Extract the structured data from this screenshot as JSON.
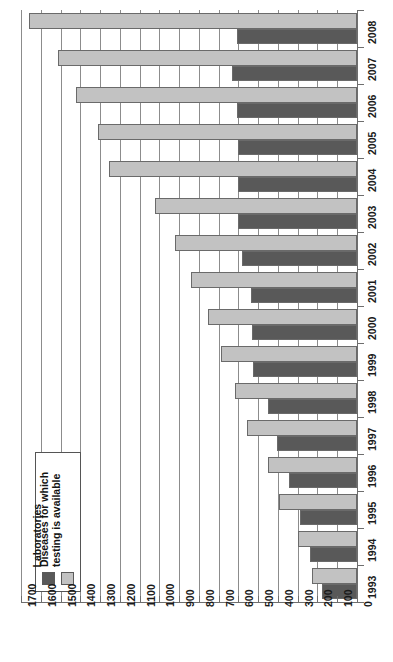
{
  "chart_data": {
    "type": "bar",
    "title": "",
    "subtitle": "",
    "xlabel": "",
    "ylabel": "",
    "orientation": "horizontal",
    "value_axis_reversed": true,
    "value_axis_ticks": [
      1700,
      1600,
      1500,
      1400,
      1300,
      1200,
      1100,
      1000,
      900,
      800,
      700,
      600,
      500,
      400,
      300,
      200,
      100,
      0
    ],
    "value_axis_range": [
      0,
      1700
    ],
    "grid": true,
    "legend_position": "bottom-left-inside",
    "categories": [
      "2008",
      "2007",
      "2006",
      "2005",
      "2004",
      "2003",
      "2002",
      "2001",
      "2000",
      "1999",
      "1998",
      "1997",
      "1996",
      "1995",
      "1994",
      "1993"
    ],
    "series": [
      {
        "name": "Diseases for which testing is available",
        "color": "#c2c2c2",
        "values": [
          1657,
          1515,
          1420,
          1310,
          1255,
          1020,
          920,
          840,
          755,
          690,
          615,
          555,
          450,
          395,
          300,
          230
        ]
      },
      {
        "name": "Laboratories",
        "color": "#595959",
        "values": [
          605,
          630,
          605,
          600,
          600,
          600,
          580,
          535,
          530,
          525,
          450,
          405,
          345,
          290,
          240,
          177
        ]
      }
    ],
    "annotations": []
  },
  "axes": {
    "value_tick_labels": [
      "1700",
      "1600",
      "1500",
      "1400",
      "1300",
      "1200",
      "1100",
      "1000",
      "900",
      "800",
      "700",
      "600",
      "500",
      "400",
      "300",
      "200",
      "100",
      "0"
    ],
    "category_tick_labels": [
      "2008",
      "2007",
      "2006",
      "2005",
      "2004",
      "2003",
      "2002",
      "2001",
      "2000",
      "1999",
      "1998",
      "1997",
      "1996",
      "1995",
      "1994",
      "1993"
    ]
  },
  "legend": {
    "entries": [
      {
        "label": "Laboratories",
        "swatch": "dark"
      },
      {
        "label": "Diseases for which testing is available",
        "swatch": "light"
      }
    ]
  }
}
